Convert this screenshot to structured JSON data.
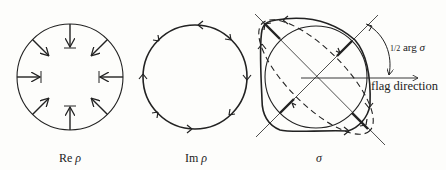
{
  "figures": [
    {
      "id": "re-rho",
      "caption_prefix": "Re ",
      "caption_symbol": "ρ"
    },
    {
      "id": "im-rho",
      "caption_prefix": "Im ",
      "caption_symbol": "ρ"
    },
    {
      "id": "sigma",
      "caption_prefix": "",
      "caption_symbol": "σ"
    }
  ],
  "annotations": {
    "half_arg_prefix": "1/2",
    "half_arg_text": " arg ",
    "half_arg_symbol": "σ",
    "flag_direction": "flag direction"
  },
  "colors": {
    "ink": "#222222",
    "background": "#fdfdfb"
  }
}
